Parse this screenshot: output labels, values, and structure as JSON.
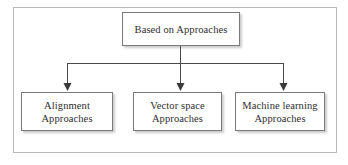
{
  "diagram": {
    "title_text": "Based on Approaches",
    "frame": {
      "border_color": "#b9b9b9"
    },
    "style": {
      "box_border_color": "#7b7b7b",
      "box_fill_color": "#ffffff",
      "text_color": "#2e2e2e",
      "connector_color": "#4a4a4a",
      "background_color": "#ffffff"
    },
    "root": {
      "id": "root",
      "label": "Based on Approaches"
    },
    "children": [
      {
        "id": "alignment",
        "label": "Alignment\nApproaches",
        "line1": "Alignment",
        "line2": "Approaches"
      },
      {
        "id": "vector-space",
        "label": "Vector space\nApproaches",
        "line1": "Vector space",
        "line2": "Approaches"
      },
      {
        "id": "machine-learning",
        "label": "Machine learning\nApproaches",
        "line1": "Machine learning",
        "line2": "Approaches"
      }
    ],
    "connector_type": "tree-orthogonal-arrows",
    "arrow_count": 3
  }
}
